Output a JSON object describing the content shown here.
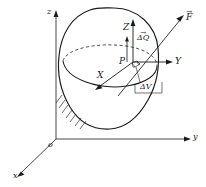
{
  "figure": {
    "type": "engineering-diagram",
    "background_color": "#ffffff",
    "line_color": "#1a1a1a"
  },
  "global_axes": {
    "origin_label": "o",
    "z_label": "z",
    "y_label": "y",
    "x_label": "x"
  },
  "local_axes": {
    "point_label": "P",
    "Z_label": "Z",
    "Y_label": "Y",
    "X_label": "X"
  },
  "annotations": {
    "delta_q": "ΔQ",
    "delta_q_accent": "→",
    "delta_v": "ΔV",
    "force": "F",
    "force_accent": "→"
  }
}
